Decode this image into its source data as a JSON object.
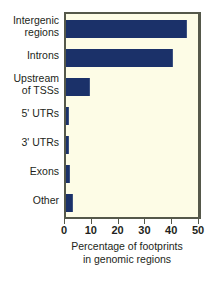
{
  "chart_data": {
    "type": "bar",
    "orientation": "horizontal",
    "title": "",
    "xlabel": "Percentage of footprints in genomic regions",
    "xlabel_line1": "Percentage of footprints",
    "xlabel_line2": "in genomic regions",
    "ylabel": "",
    "categories": [
      "Intergenic\nregions",
      "Introns",
      "Upstream\nof TSSs",
      "5' UTRs",
      "3' UTRs",
      "Exons",
      "Other"
    ],
    "values": [
      45,
      40,
      9,
      1,
      1,
      1.5,
      2.5
    ],
    "xlim": [
      0,
      50
    ],
    "xticks": [
      0,
      10,
      20,
      30,
      40,
      50
    ],
    "xticklabels": [
      "0",
      "10",
      "20",
      "30",
      "40",
      "50"
    ],
    "grid": false,
    "legend": null,
    "colors": {
      "bar": "#1b3169",
      "plot_background": "#fdfce6",
      "axis": "#55584a",
      "text": "#231f20",
      "page_background": "#ffffff"
    }
  }
}
